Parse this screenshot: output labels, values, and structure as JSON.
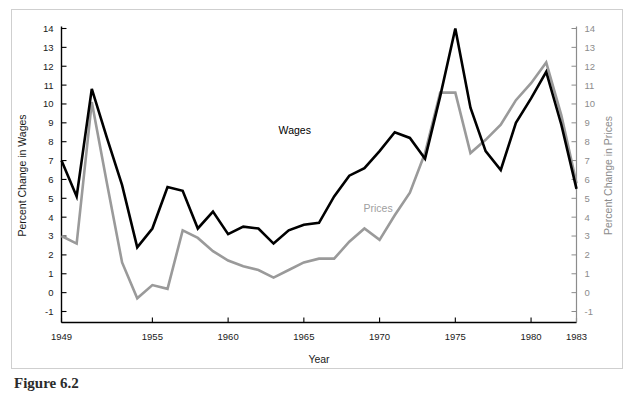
{
  "caption": "Figure 6.2",
  "chart_data": {
    "type": "line",
    "title": "",
    "xlabel": "Year",
    "ylabel": "Percent Change in Wages",
    "ylabel_right": "Percent Change in Prices",
    "grid": false,
    "legend_position": "inline-annotations",
    "xlim": [
      1949,
      1983
    ],
    "ylim": [
      -1.6,
      14.6
    ],
    "yticks": [
      14,
      13,
      12,
      11,
      10,
      9,
      8,
      7,
      6,
      5,
      4,
      3,
      2,
      1,
      0,
      -1
    ],
    "ytick_labels": [
      "14",
      "13",
      "12",
      "11",
      "10",
      "9",
      "8",
      "7",
      "6",
      "5",
      "4",
      "3",
      "2",
      "1",
      "0",
      "-1"
    ],
    "yticks_right": [
      14,
      13,
      12,
      11,
      10,
      9,
      8,
      7,
      6,
      5,
      4,
      3,
      2,
      1,
      0,
      -1
    ],
    "ytick_labels_right": [
      "14",
      "13",
      "12",
      "11",
      "10",
      "9",
      "8",
      "7",
      "6",
      "5",
      "4",
      "3",
      "2",
      "1",
      "0",
      "-1"
    ],
    "xticks": [
      1949,
      1955,
      1960,
      1965,
      1970,
      1975,
      1980,
      1983
    ],
    "xtick_labels": [
      "1949",
      "1955",
      "1960",
      "1965",
      "1970",
      "1975",
      "1980",
      "1983"
    ],
    "x": [
      1949,
      1950,
      1951,
      1952,
      1953,
      1954,
      1955,
      1956,
      1957,
      1958,
      1959,
      1960,
      1961,
      1962,
      1963,
      1964,
      1965,
      1966,
      1967,
      1968,
      1969,
      1970,
      1971,
      1972,
      1973,
      1974,
      1975,
      1976,
      1977,
      1978,
      1979,
      1980,
      1981,
      1982,
      1983
    ],
    "series": [
      {
        "name": "Wages",
        "color": "#000000",
        "label_x": 1964.4,
        "label_y": 8.4,
        "values": [
          7.0,
          5.1,
          10.8,
          8.2,
          5.7,
          2.4,
          3.4,
          5.6,
          5.4,
          3.4,
          4.3,
          3.1,
          3.5,
          3.4,
          2.6,
          3.3,
          3.6,
          3.7,
          5.1,
          6.2,
          6.6,
          7.5,
          8.5,
          8.2,
          7.1,
          10.4,
          14.0,
          9.8,
          7.5,
          6.5,
          9.0,
          10.3,
          11.7,
          8.9,
          5.5
        ]
      },
      {
        "name": "Prices",
        "color": "#9a9a9a",
        "label_x": 1969.9,
        "label_y": 4.3,
        "values": [
          3.0,
          2.6,
          10.1,
          5.8,
          1.6,
          -0.3,
          0.4,
          0.2,
          3.3,
          2.9,
          2.2,
          1.7,
          1.4,
          1.2,
          0.8,
          1.2,
          1.6,
          1.8,
          1.8,
          2.7,
          3.4,
          2.8,
          4.1,
          5.3,
          7.4,
          10.6,
          10.6,
          7.4,
          8.1,
          8.9,
          10.2,
          11.1,
          12.2,
          9.4,
          5.8
        ]
      }
    ]
  }
}
